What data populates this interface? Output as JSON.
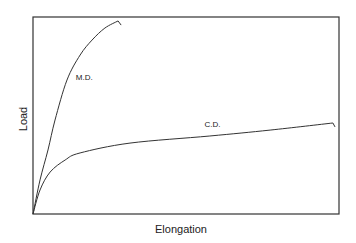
{
  "chart_data": {
    "type": "line",
    "title": "",
    "xlabel": "Elongation",
    "ylabel": "Load",
    "xlim": [
      0,
      1
    ],
    "ylim": [
      0,
      1
    ],
    "grid": false,
    "ticks": "none",
    "series": [
      {
        "name": "M.D.",
        "label": "M.D.",
        "x": [
          0,
          0.023,
          0.049,
          0.072,
          0.111,
          0.154,
          0.193,
          0.235,
          0.278,
          0.288
        ],
        "y": [
          0,
          0.173,
          0.325,
          0.477,
          0.68,
          0.807,
          0.883,
          0.944,
          0.98,
          0.959
        ]
      },
      {
        "name": "C.D.",
        "label": "C.D.",
        "x": [
          0,
          0.023,
          0.056,
          0.105,
          0.154,
          0.317,
          0.578,
          0.775,
          0.98,
          0.987
        ],
        "y": [
          0,
          0.122,
          0.213,
          0.274,
          0.31,
          0.36,
          0.396,
          0.426,
          0.462,
          0.442
        ]
      }
    ],
    "annotations": [
      {
        "text": "M.D.",
        "series": "M.D.",
        "x": 0.14,
        "y": 0.68
      },
      {
        "text": "C.D.",
        "series": "C.D.",
        "x": 0.56,
        "y": 0.44
      }
    ],
    "colors": {
      "line": "#333333",
      "frame": "#333333",
      "text": "#222222"
    }
  }
}
